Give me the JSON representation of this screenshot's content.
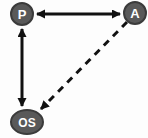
{
  "diagram": {
    "nodes": [
      {
        "id": "P",
        "label": "P",
        "shape": "circle",
        "position": "top-left"
      },
      {
        "id": "A",
        "label": "A",
        "shape": "circle",
        "position": "top-right"
      },
      {
        "id": "OS",
        "label": "OS",
        "shape": "ellipse",
        "position": "bottom-left"
      }
    ],
    "edges": [
      {
        "from": "P",
        "to": "A",
        "style": "solid",
        "direction": "bidirectional"
      },
      {
        "from": "P",
        "to": "OS",
        "style": "solid",
        "direction": "bidirectional"
      },
      {
        "from": "A",
        "to": "OS",
        "style": "dashed",
        "direction": "one-way-to-OS"
      }
    ],
    "colors": {
      "node_fill": "#595959",
      "node_border": "#3b3b3b",
      "node_text": "#ffffff",
      "edge": "#111111",
      "background": "#fdfdfd"
    }
  }
}
